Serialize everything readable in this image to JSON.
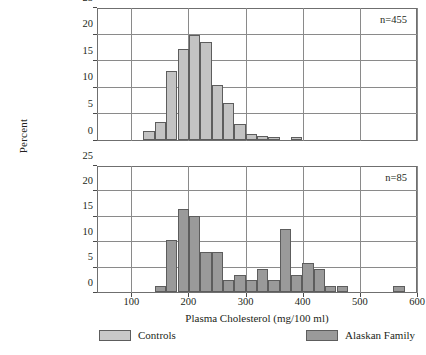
{
  "chart_data": {
    "type": "bar",
    "title": "",
    "xlabel": "Plasma Cholesterol (mg/100 ml)",
    "ylabel": "Percent",
    "xlim": [
      40,
      600
    ],
    "ylim": [
      0,
      25
    ],
    "xticks": [
      100,
      200,
      300,
      400,
      500,
      600
    ],
    "yticks": [
      0,
      5,
      10,
      15,
      20,
      25
    ],
    "grid": true,
    "bin_width": 20,
    "legend_position": "bottom",
    "panels": [
      {
        "name": "controls",
        "annotation": "n=455",
        "series_name": "Controls",
        "color": "#c3c3c3",
        "bin_starts": [
          120,
          140,
          160,
          180,
          200,
          220,
          240,
          260,
          280,
          300,
          320,
          340,
          380
        ],
        "values": [
          1.8,
          3.5,
          13.2,
          17.4,
          20.0,
          18.7,
          10.5,
          7.0,
          3.1,
          1.2,
          0.8,
          0.5,
          0.5
        ]
      },
      {
        "name": "alaskan_family",
        "annotation": "n=85",
        "series_name": "Alaskan Family",
        "color": "#9a9a9a",
        "bin_starts": [
          140,
          160,
          180,
          200,
          220,
          240,
          260,
          280,
          300,
          320,
          340,
          360,
          380,
          400,
          420,
          440,
          460,
          560
        ],
        "values": [
          1.2,
          10.4,
          16.7,
          15.3,
          8.1,
          8.1,
          2.4,
          3.5,
          2.4,
          4.7,
          2.4,
          12.6,
          3.5,
          5.9,
          4.7,
          1.2,
          1.2,
          1.2
        ]
      }
    ]
  },
  "legend": {
    "items": [
      {
        "label": "Controls",
        "color": "#c8c8c8"
      },
      {
        "label": "Alaskan Family",
        "color": "#9a9a9a"
      }
    ]
  }
}
